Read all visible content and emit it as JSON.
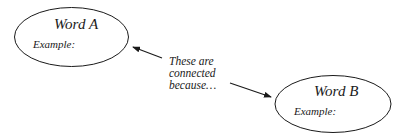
{
  "diagram": {
    "node_a": {
      "title": "Word A",
      "example_label": "Example:"
    },
    "node_b": {
      "title": "Word B",
      "example_label": "Example:"
    },
    "connector": {
      "line1": "These are",
      "line2": "connected",
      "line3": "because…"
    }
  }
}
